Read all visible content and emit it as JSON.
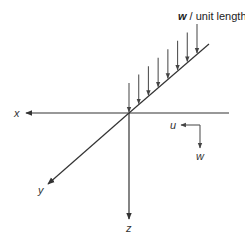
{
  "diagram": {
    "load_label_symbol": "w",
    "load_label_text": " / unit length",
    "load_arrow_count": 8,
    "axes": {
      "x": "x",
      "y": "y",
      "z": "z"
    },
    "displacement_axes": {
      "u": "u",
      "w": "w"
    },
    "colors": {
      "line": "#333333",
      "arrow": "#555555",
      "background": "#ffffff"
    }
  }
}
